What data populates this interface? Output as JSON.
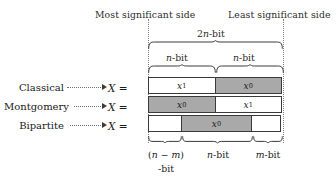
{
  "figure": {
    "type": "bit-field-partition-diagram",
    "top_captions": {
      "most_significant": "Most significant side",
      "least_significant": "Least significant side"
    },
    "braces": {
      "total": "2n-bit",
      "half_left": "n-bit",
      "half_right": "n-bit"
    },
    "rows": [
      {
        "name": "Classical",
        "equals": "X =",
        "cells": [
          {
            "label": "x",
            "sub": "1",
            "filled": false,
            "width_pct": 50
          },
          {
            "label": "x",
            "sub": "0",
            "filled": true,
            "width_pct": 50
          }
        ]
      },
      {
        "name": "Montgomery",
        "equals": "X =",
        "cells": [
          {
            "label": "x",
            "sub": "0",
            "filled": true,
            "width_pct": 50
          },
          {
            "label": "x",
            "sub": "1",
            "filled": false,
            "width_pct": 50
          }
        ]
      },
      {
        "name": "Bipartite",
        "equals": "X =",
        "cells": [
          {
            "label": "",
            "sub": "",
            "filled": false,
            "width_pct": 25.2
          },
          {
            "label": "x",
            "sub": "0",
            "filled": true,
            "width_pct": 52.6
          },
          {
            "label": "",
            "sub": "",
            "filled": false,
            "width_pct": 22.2
          }
        ]
      }
    ],
    "bottom_labels": {
      "first_line1": "(n − m)",
      "first_line2": "-bit",
      "second": "n-bit",
      "third": "m-bit"
    },
    "colors": {
      "fill_gray": "#a9a9a9",
      "stroke": "#3a3a3a",
      "text": "#2b2b2b",
      "background": "#ffffff"
    }
  }
}
